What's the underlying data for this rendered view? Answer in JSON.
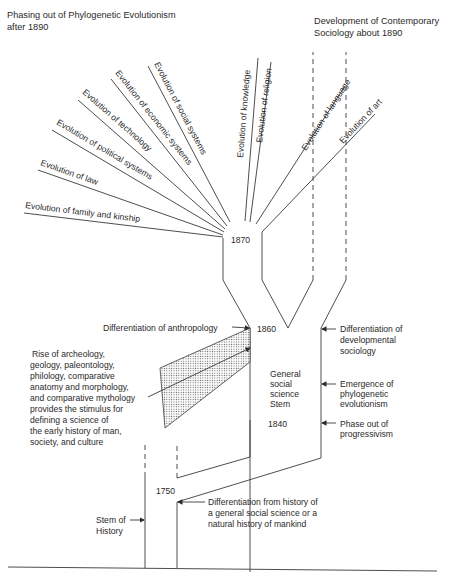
{
  "header": {
    "left_title_line1": "Phasing out of Phylogenetic Evolutionism",
    "left_title_line2": "after 1890",
    "right_title_line1": "Development of Contemporary",
    "right_title_line2": "Sociology about 1890"
  },
  "branches": [
    "Evolution of  family and kinship",
    "Evolution of law",
    "Evolution of political systems",
    "Evolution of technology",
    "Evolution of economic systems",
    "Evolution of social systems",
    "Evolution of knowledge",
    "Evolution of religion",
    "Evolution of language",
    "Evolution of art"
  ],
  "years": {
    "y1870": "1870",
    "y1860": "1860",
    "y1840": "1840",
    "y1750": "1750"
  },
  "labels": {
    "differentiation_anthropology": "Differentiation of anthropology",
    "differentiation_developmental": [
      "Differentiation of",
      "developmental",
      "sociology"
    ],
    "emergence": [
      "Emergence of",
      "phylogenetic",
      "evolutionism"
    ],
    "phase_out": [
      "Phase out of",
      "progressivism"
    ],
    "general_stem": [
      "General",
      "social",
      "science",
      "Stem"
    ],
    "rise_of": [
      "Rise of archeology,",
      "geology, paleontology,",
      "philology, comparative",
      "anatomy and morphology,",
      "and comparative mythology",
      "provides the stimulus for",
      "defining a science of",
      "the early history of man,",
      "society, and culture"
    ],
    "stem_of_history": [
      "Stem of",
      "History"
    ],
    "differentiation_history": [
      "Differentiation from history of",
      "a general social science or a",
      "natural history of  mankind"
    ]
  }
}
